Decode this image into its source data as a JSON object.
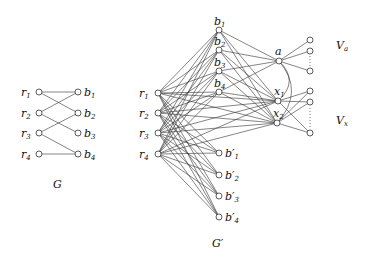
{
  "graph_G": {
    "caption": "G",
    "r_nodes": [
      {
        "id": "r1",
        "label": "r",
        "sub": "1",
        "x": 39,
        "y": 92
      },
      {
        "id": "r2",
        "label": "r",
        "sub": "2",
        "x": 39,
        "y": 113
      },
      {
        "id": "r3",
        "label": "r",
        "sub": "3",
        "x": 39,
        "y": 133
      },
      {
        "id": "r4",
        "label": "r",
        "sub": "4",
        "x": 39,
        "y": 154
      }
    ],
    "b_nodes": [
      {
        "id": "b1",
        "label": "b",
        "sub": "1",
        "x": 78,
        "y": 92
      },
      {
        "id": "b2",
        "label": "b",
        "sub": "2",
        "x": 78,
        "y": 113
      },
      {
        "id": "b3",
        "label": "b",
        "sub": "3",
        "x": 78,
        "y": 133
      },
      {
        "id": "b4",
        "label": "b",
        "sub": "4",
        "x": 78,
        "y": 154
      }
    ],
    "edges": [
      [
        "r1",
        "b1"
      ],
      [
        "r1",
        "b2"
      ],
      [
        "r2",
        "b1"
      ],
      [
        "r2",
        "b3"
      ],
      [
        "r3",
        "b2"
      ],
      [
        "r3",
        "b4"
      ],
      [
        "r4",
        "b4"
      ]
    ]
  },
  "graph_Gprime": {
    "caption": "G′",
    "r_nodes": [
      {
        "id": "r1",
        "label": "r",
        "sub": "1",
        "x": 158,
        "y": 93
      },
      {
        "id": "r2",
        "label": "r",
        "sub": "2",
        "x": 158,
        "y": 113
      },
      {
        "id": "r3",
        "label": "r",
        "sub": "3",
        "x": 158,
        "y": 133
      },
      {
        "id": "r4",
        "label": "r",
        "sub": "4",
        "x": 158,
        "y": 154
      }
    ],
    "b_nodes": [
      {
        "id": "b1",
        "label": "b",
        "sub": "1",
        "x": 219,
        "y": 30
      },
      {
        "id": "b2",
        "label": "b",
        "sub": "2",
        "x": 219,
        "y": 50
      },
      {
        "id": "b3",
        "label": "b",
        "sub": "3",
        "x": 219,
        "y": 71
      },
      {
        "id": "b4",
        "label": "b",
        "sub": "4",
        "x": 219,
        "y": 92
      }
    ],
    "bprime_nodes": [
      {
        "id": "bp1",
        "label": "b′",
        "sub": "1",
        "x": 219,
        "y": 153
      },
      {
        "id": "bp2",
        "label": "b′",
        "sub": "2",
        "x": 219,
        "y": 175
      },
      {
        "id": "bp3",
        "label": "b′",
        "sub": "3",
        "x": 219,
        "y": 196
      },
      {
        "id": "bp4",
        "label": "b′",
        "sub": "4",
        "x": 219,
        "y": 217
      }
    ],
    "hub_nodes": [
      {
        "id": "a",
        "label": "a",
        "sub": "",
        "x": 279,
        "y": 61
      },
      {
        "id": "x1",
        "label": "x",
        "sub": "1",
        "x": 278,
        "y": 101
      },
      {
        "id": "x2",
        "label": "x",
        "sub": "2",
        "x": 277,
        "y": 123
      }
    ],
    "Va_nodes": [
      {
        "id": "va1",
        "x": 310,
        "y": 40
      },
      {
        "id": "va2",
        "x": 310,
        "y": 51
      },
      {
        "id": "va3",
        "x": 310,
        "y": 71
      }
    ],
    "Vx_nodes": [
      {
        "id": "vx1",
        "x": 310,
        "y": 91
      },
      {
        "id": "vx2",
        "x": 310,
        "y": 102
      },
      {
        "id": "vx3",
        "x": 310,
        "y": 133
      }
    ],
    "set_labels": {
      "Va": "V",
      "Va_sub": "a",
      "Vx": "V",
      "Vx_sub": "x"
    }
  }
}
